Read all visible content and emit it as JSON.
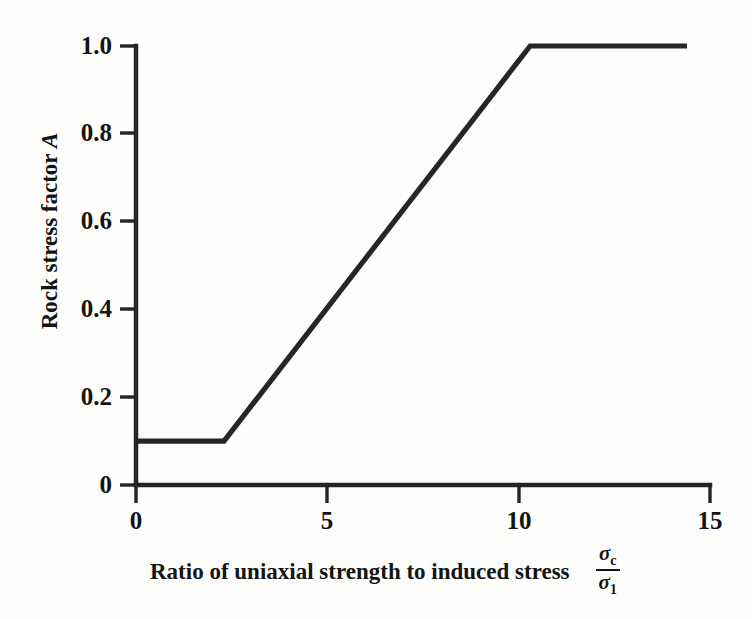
{
  "chart_data": {
    "type": "line",
    "title": "",
    "xlabel": "Ratio of uniaxial strength to induced stress",
    "xlabel_fraction": {
      "numerator": "σ",
      "numerator_sub": "c",
      "denominator": "σ",
      "denominator_sub": "1"
    },
    "ylabel": "Rock stress factor",
    "ylabel_symbol": "A",
    "xlim": [
      0,
      15
    ],
    "ylim": [
      0,
      1.0
    ],
    "xticks": [
      0,
      5,
      10,
      15
    ],
    "xtick_labels": [
      "0",
      "5",
      "10",
      "15"
    ],
    "yticks": [
      0,
      0.2,
      0.4,
      0.6,
      0.8,
      1.0
    ],
    "ytick_labels": [
      "0",
      "0.2",
      "0.4",
      "0.6",
      "0.8",
      "1.0"
    ],
    "grid": false,
    "legend": "none",
    "series": [
      {
        "name": "Rock stress factor A",
        "color": "#262626",
        "x": [
          0,
          2.3,
          10.3,
          14.4
        ],
        "values": [
          0.1,
          0.1,
          1.0,
          1.0
        ]
      }
    ],
    "line_color": "#262626",
    "axis_color": "#242424",
    "background_color": "#fdfdfc"
  }
}
